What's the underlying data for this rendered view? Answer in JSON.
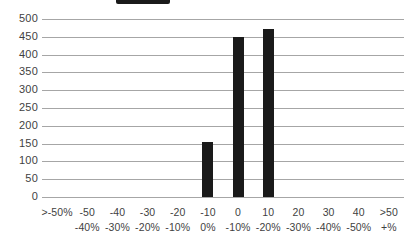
{
  "header": {
    "legend_swatch_label": "",
    "title_remnant": "",
    "legend_swatch_color": "#1a1a1a"
  },
  "colors": {
    "bar": "#1a1a1a",
    "gridline": "#a6a6a6",
    "text": "#3f3f3f",
    "background": "#ffffff"
  },
  "chart_data": {
    "type": "bar",
    "title": "",
    "subtitle": "",
    "xlabel": "",
    "ylabel": "",
    "ylim": [
      0,
      500
    ],
    "ytick_step": 50,
    "grid": true,
    "legend_position": "top",
    "categories": [
      ">-50%",
      "-50 -40%",
      "-40 -30%",
      "-30 -20%",
      "-20 -10%",
      "-10 0%",
      "0 -10%",
      "10 -20%",
      "20 -30%",
      "30 -40%",
      "40 -50%",
      ">50 +%"
    ],
    "category_lines": [
      [
        ">-50%",
        ""
      ],
      [
        "-50",
        "-40%"
      ],
      [
        "-40",
        "-30%"
      ],
      [
        "-30",
        "-20%"
      ],
      [
        "-20",
        "-10%"
      ],
      [
        "-10",
        "0%"
      ],
      [
        "0",
        "-10%"
      ],
      [
        "10",
        "-20%"
      ],
      [
        "20",
        "-30%"
      ],
      [
        "30",
        "-40%"
      ],
      [
        "40",
        "-50%"
      ],
      [
        ">50",
        "+%"
      ]
    ],
    "values": [
      0,
      0,
      0,
      0,
      0,
      155,
      450,
      473,
      0,
      0,
      0,
      0
    ],
    "ytick_labels": [
      "500",
      "450",
      "400",
      "350",
      "300",
      "250",
      "200",
      "150",
      "100",
      "50",
      "0"
    ],
    "yticks": [
      500,
      450,
      400,
      350,
      300,
      250,
      200,
      150,
      100,
      50,
      0
    ]
  }
}
